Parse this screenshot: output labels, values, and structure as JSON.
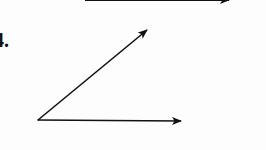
{
  "problem": {
    "number_label": "4."
  },
  "diagram": {
    "type": "angle",
    "stroke_color": "#111111",
    "vertex": {
      "x": 38,
      "y": 120
    },
    "rays": [
      {
        "name": "upper-ray",
        "tip": {
          "x": 148,
          "y": 29
        }
      },
      {
        "name": "lower-ray",
        "tip": {
          "x": 182,
          "y": 121
        }
      }
    ],
    "previous_problem_arrow": {
      "from": {
        "x": 85,
        "y": 0
      },
      "tip": {
        "x": 230,
        "y": 0
      }
    }
  }
}
